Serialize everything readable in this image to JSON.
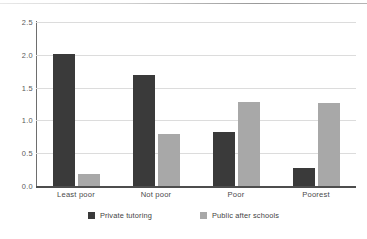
{
  "chart_data": {
    "type": "bar",
    "title": "",
    "xlabel": "",
    "ylabel": "",
    "ylim": [
      0.0,
      2.5
    ],
    "ytick_labels": [
      "0.0",
      "0.5",
      "1.0",
      "1.5",
      "2.0",
      "2.5"
    ],
    "ytick_values": [
      0.0,
      0.5,
      1.0,
      1.5,
      2.0,
      2.5
    ],
    "grid": true,
    "grid_axis": "y",
    "legend_position": "bottom-center",
    "categories": [
      "Least poor",
      "Not poor",
      "Poor",
      "Poorest"
    ],
    "series": [
      {
        "name": "Private tutoring",
        "color": "#3a3a3a",
        "values": [
          2.01,
          1.69,
          0.83,
          0.27
        ]
      },
      {
        "name": "Public after schools",
        "color": "#a8a8a8",
        "values": [
          0.18,
          0.8,
          1.28,
          1.27
        ]
      }
    ]
  }
}
